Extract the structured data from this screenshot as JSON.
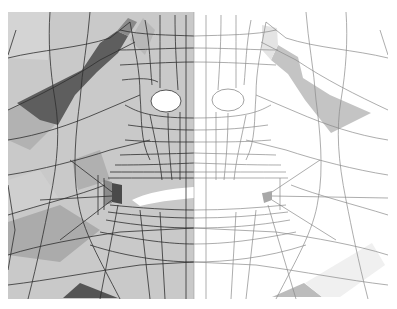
{
  "figure": {
    "frame": {
      "x": 8,
      "y": 12,
      "width": 380,
      "height": 287
    },
    "split_x": 194,
    "colors": {
      "background": "#ffffff",
      "shaded_base": "#c9c9c9",
      "shaded_light": "#d6d6d6",
      "shaded_mid": "#a9a9a9",
      "shaded_dark": "#5c5c5c",
      "wire_base": "#ffffff",
      "wire_highlight": "#c4c4c4",
      "wire_highlight_light": "#e6e6e6",
      "line_dark": "#2e2e2e",
      "line_light": "#8a8a8a"
    },
    "features": {
      "left_eye": {
        "cx": 166,
        "cy": 100,
        "rx": 15,
        "ry": 11
      },
      "right_eye": {
        "cx": 228,
        "cy": 100,
        "rx": 16,
        "ry": 11
      },
      "mouth": {
        "x1": 125,
        "x2": 275,
        "cy": 196
      }
    }
  }
}
